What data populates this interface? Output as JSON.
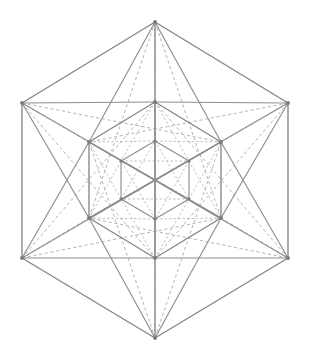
{
  "figure": {
    "kind": "sacred-geometry-line-diagram",
    "canvas": {
      "width": 310,
      "height": 361
    },
    "background_color": "#ffffff",
    "solid_line_color": "#8e8e8e",
    "dashed_line_color": "#a6a6a6",
    "vertex_color": "#7d7d7d",
    "center": {
      "x": 155,
      "y": 180
    }
  },
  "chart_data": {
    "type": "diagram",
    "grid": false,
    "legend": false,
    "xlabel": "",
    "ylabel": "",
    "xlim": [
      0,
      310
    ],
    "ylim": [
      0,
      361
    ],
    "rings": [
      {
        "name": "outer-hexagon",
        "scale": 1.0,
        "vertices": [
          {
            "id": "O0",
            "label": "top",
            "x": 155,
            "y": 22
          },
          {
            "id": "O1",
            "label": "upper-right",
            "x": 288,
            "y": 103
          },
          {
            "id": "O2",
            "label": "lower-right",
            "x": 288,
            "y": 258
          },
          {
            "id": "O3",
            "label": "bottom",
            "x": 155,
            "y": 338
          },
          {
            "id": "O4",
            "label": "lower-left",
            "x": 22,
            "y": 258
          },
          {
            "id": "O5",
            "label": "upper-left",
            "x": 22,
            "y": 103
          }
        ]
      },
      {
        "name": "middle-hexagon",
        "scale": 0.515,
        "vertices": [
          {
            "id": "M0",
            "label": "top",
            "x": 155,
            "y": 102
          },
          {
            "id": "M1",
            "label": "upper-right",
            "x": 221,
            "y": 142
          },
          {
            "id": "M2",
            "label": "lower-right",
            "x": 221,
            "y": 218
          },
          {
            "id": "M3",
            "label": "bottom",
            "x": 155,
            "y": 258
          },
          {
            "id": "M4",
            "label": "lower-left",
            "x": 89,
            "y": 218
          },
          {
            "id": "M5",
            "label": "upper-left",
            "x": 89,
            "y": 142
          }
        ]
      },
      {
        "name": "inner-hexagon",
        "scale": 0.265,
        "vertices": [
          {
            "id": "I0",
            "label": "top",
            "x": 155,
            "y": 141
          },
          {
            "id": "I1",
            "label": "upper-right",
            "x": 189,
            "y": 161
          },
          {
            "id": "I2",
            "label": "lower-right",
            "x": 189,
            "y": 199
          },
          {
            "id": "I3",
            "label": "bottom",
            "x": 155,
            "y": 219
          },
          {
            "id": "I4",
            "label": "lower-left",
            "x": 121,
            "y": 199
          },
          {
            "id": "I5",
            "label": "upper-left",
            "x": 121,
            "y": 161
          }
        ]
      }
    ],
    "edge_groups": [
      {
        "name": "outer-hexagon-perimeter",
        "style": "solid",
        "count": 6
      },
      {
        "name": "outer-long-diagonals",
        "style": "solid",
        "count": 3
      },
      {
        "name": "middle-hexagon-perimeter",
        "style": "solid",
        "count": 6
      },
      {
        "name": "middle-long-diagonals",
        "style": "solid",
        "count": 3
      },
      {
        "name": "inner-hexagon-perimeter",
        "style": "solid",
        "count": 6
      },
      {
        "name": "outer-to-middle-spokes",
        "style": "solid",
        "count": 18
      },
      {
        "name": "outer-to-middle-hidden",
        "style": "dashed",
        "count": 18
      },
      {
        "name": "middle-to-inner-hidden",
        "style": "dashed",
        "count": 18
      },
      {
        "name": "inner-cross-chords",
        "style": "dashed",
        "count": 9
      }
    ],
    "vertex_marker_radius": 2.0,
    "total_vertices": 18
  }
}
